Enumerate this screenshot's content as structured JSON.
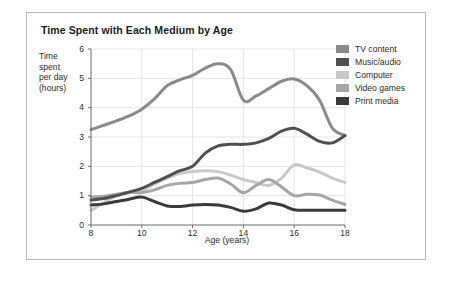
{
  "card": {
    "border_color": "#b9b9b9",
    "background": "#ffffff"
  },
  "chart": {
    "title": "Time Spent with Each Medium by Age",
    "ylabel_lines": [
      "Time",
      "spent",
      "per day",
      "(hours)"
    ],
    "xlabel": "Age (years)"
  },
  "axes": {
    "yticks": [
      "0",
      "1",
      "2",
      "3",
      "4",
      "5",
      "6"
    ],
    "xticks": [
      "8",
      "10",
      "12",
      "14",
      "16",
      "18"
    ]
  },
  "legend": {
    "items": [
      {
        "label": "TV content",
        "color": "#8a8a8a"
      },
      {
        "label": "Music/audio",
        "color": "#4f4f4f"
      },
      {
        "label": "Computer",
        "color": "#c9c9c9"
      },
      {
        "label": "Video games",
        "color": "#a6a6a6"
      },
      {
        "label": "Print media",
        "color": "#3a3a3a"
      }
    ]
  },
  "chart_data": {
    "type": "line",
    "title": "Time Spent with Each Medium by Age",
    "xlabel": "Age (years)",
    "ylabel": "Time spent per day (hours)",
    "xlim": [
      8,
      18
    ],
    "ylim": [
      0,
      6
    ],
    "xticks": [
      8,
      10,
      12,
      14,
      16,
      18
    ],
    "yticks": [
      0,
      1,
      2,
      3,
      4,
      5,
      6
    ],
    "grid": true,
    "legend_position": "right",
    "x": [
      8,
      8.5,
      9,
      9.5,
      10,
      10.5,
      11,
      11.5,
      12,
      12.5,
      13,
      13.5,
      14,
      14.5,
      15,
      15.5,
      16,
      16.5,
      17,
      17.5,
      18
    ],
    "series": [
      {
        "name": "TV content",
        "color": "#8a8a8a",
        "values": [
          3.25,
          3.4,
          3.55,
          3.72,
          3.95,
          4.3,
          4.75,
          4.95,
          5.1,
          5.35,
          5.5,
          5.3,
          4.25,
          4.4,
          4.65,
          4.9,
          4.98,
          4.75,
          4.25,
          3.3,
          3.05
        ]
      },
      {
        "name": "Music/audio",
        "color": "#4f4f4f",
        "values": [
          0.85,
          0.9,
          1.0,
          1.12,
          1.25,
          1.45,
          1.65,
          1.85,
          2.0,
          2.45,
          2.7,
          2.75,
          2.75,
          2.8,
          2.95,
          3.2,
          3.3,
          3.1,
          2.85,
          2.8,
          3.05
        ]
      },
      {
        "name": "Computer",
        "color": "#c9c9c9",
        "values": [
          0.5,
          0.75,
          1.0,
          1.1,
          1.15,
          1.4,
          1.6,
          1.75,
          1.82,
          1.85,
          1.82,
          1.7,
          1.55,
          1.45,
          1.35,
          1.6,
          2.05,
          1.95,
          1.8,
          1.6,
          1.45
        ]
      },
      {
        "name": "Video games",
        "color": "#a6a6a6",
        "values": [
          0.95,
          0.98,
          1.05,
          1.12,
          1.1,
          1.2,
          1.35,
          1.42,
          1.45,
          1.55,
          1.6,
          1.4,
          1.1,
          1.35,
          1.55,
          1.3,
          1.0,
          1.05,
          1.02,
          0.85,
          0.7
        ]
      },
      {
        "name": "Print media",
        "color": "#3a3a3a",
        "values": [
          0.68,
          0.72,
          0.8,
          0.88,
          0.95,
          0.8,
          0.65,
          0.63,
          0.68,
          0.7,
          0.68,
          0.6,
          0.47,
          0.55,
          0.75,
          0.68,
          0.52,
          0.5,
          0.5,
          0.5,
          0.5
        ]
      }
    ]
  }
}
